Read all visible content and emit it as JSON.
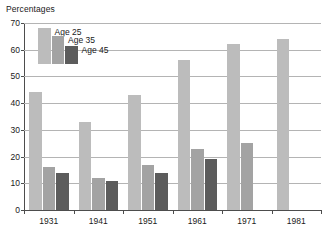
{
  "chart_data": {
    "type": "bar",
    "title": "Percentages",
    "xlabel": "",
    "ylabel": "",
    "ylim": [
      0,
      70
    ],
    "ytick_step": 10,
    "yticks": [
      0,
      10,
      20,
      30,
      40,
      50,
      60,
      70
    ],
    "grid": true,
    "legend_position": "top-left-inside",
    "categories": [
      "1931",
      "1941",
      "1951",
      "1961",
      "1971",
      "1981"
    ],
    "series": [
      {
        "name": "Age 25",
        "color": "#bcbcbc",
        "values": [
          44,
          33,
          43,
          56,
          62,
          64
        ]
      },
      {
        "name": "Age 35",
        "color": "#a3a3a3",
        "values": [
          16,
          12,
          17,
          23,
          25,
          null
        ]
      },
      {
        "name": "Age 45",
        "color": "#5c5c5c",
        "values": [
          14,
          11,
          14,
          19,
          null,
          null
        ]
      }
    ]
  },
  "legend": {
    "entries": [
      {
        "label": "Age 25"
      },
      {
        "label": "Age 35"
      },
      {
        "label": "Age 45"
      }
    ]
  },
  "axes": {
    "y_tick_labels": [
      "70",
      "60",
      "50",
      "40",
      "30",
      "20",
      "10",
      "0"
    ],
    "x_tick_labels": [
      "1931",
      "1941",
      "1951",
      "1961",
      "1971",
      "1981"
    ]
  },
  "colors": {
    "series_1": "#bcbcbc",
    "series_2": "#a3a3a3",
    "series_3": "#5c5c5c",
    "gridline": "#b4b4b4",
    "axis": "#4d4d4d",
    "text": "#1a1a1a",
    "background": "#ffffff"
  }
}
